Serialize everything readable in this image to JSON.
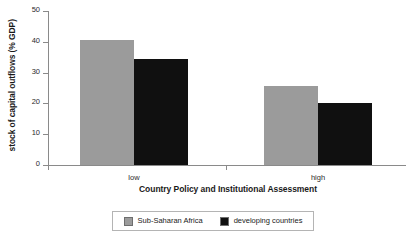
{
  "chart_data": {
    "type": "bar",
    "title": "",
    "xlabel": "Country Policy and Institutional Assessment",
    "ylabel": "stock of capital outflows (% GDP)",
    "categories": [
      "low",
      "high"
    ],
    "series": [
      {
        "name": "Sub-Saharan Africa",
        "color": "#9b9b9b",
        "values": [
          40.5,
          25.5
        ]
      },
      {
        "name": "developing countries",
        "color": "#101010",
        "values": [
          34.5,
          20.0
        ]
      }
    ],
    "ylim": [
      0,
      50
    ],
    "yticks": [
      0,
      10,
      20,
      30,
      40,
      50
    ],
    "ytick_labels": [
      "0",
      "10",
      "20",
      "30",
      "40",
      "50"
    ],
    "grid": false,
    "legend_position": "bottom"
  },
  "axes": {
    "y_title": "stock of capital outflows (% GDP)",
    "x_title": "Country Policy and Institutional Assessment"
  },
  "legend": {
    "entries": [
      {
        "label": "Sub-Saharan Africa",
        "color": "#9b9b9b"
      },
      {
        "label": "developing countries",
        "color": "#101010"
      }
    ]
  }
}
